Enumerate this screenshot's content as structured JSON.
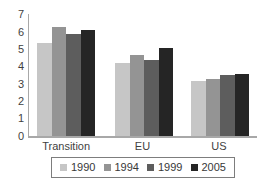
{
  "chart_data": {
    "type": "bar",
    "title": "",
    "xlabel": "",
    "ylabel": "",
    "categories": [
      "Transition",
      "EU",
      "US"
    ],
    "series": [
      {
        "name": "1990",
        "color": "#c6c6c6",
        "values": [
          5.4,
          4.2,
          3.2
        ]
      },
      {
        "name": "1994",
        "color": "#949494",
        "values": [
          6.3,
          4.7,
          3.3
        ]
      },
      {
        "name": "1999",
        "color": "#5d5d5d",
        "values": [
          5.9,
          4.4,
          3.5
        ]
      },
      {
        "name": "2005",
        "color": "#252525",
        "values": [
          6.1,
          5.1,
          3.6
        ]
      }
    ],
    "ylim": [
      0,
      7
    ],
    "yticks": [
      0,
      1,
      2,
      3,
      4,
      5,
      6,
      7
    ],
    "grid": false,
    "legend_position": "bottom"
  },
  "colors": {
    "background": "#ffffff",
    "axis": "#a8a8a8",
    "text": "#3f3f3f",
    "legend_border": "#7d7d7d"
  }
}
